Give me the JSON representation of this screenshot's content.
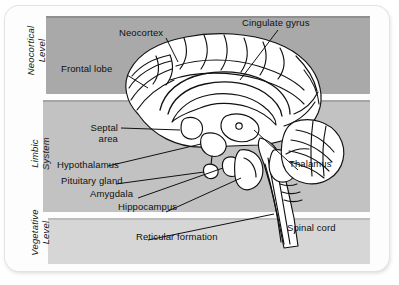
{
  "figure": {
    "kind": "mid-sagittal-brain-diagram",
    "background_color": "#ffffff"
  },
  "levels": [
    {
      "id": "neocortical",
      "label": "Neocortical\nLevel",
      "band_color": "#a9a9a9"
    },
    {
      "id": "limbic",
      "label": "Limbic\nSystem",
      "band_color": "#c2c2c2"
    },
    {
      "id": "vegetative",
      "label": "Vegetative\nLevel",
      "band_color": "#d6d6d6"
    }
  ],
  "labels": {
    "neocortex": "Neocortex",
    "cingulate_gyrus": "Cingulate gyrus",
    "frontal_lobe": "Frontal lobe",
    "septal_area": "Septal\narea",
    "hypothalamus": "Hypothalamus",
    "pituitary_gland": "Pituitary gland",
    "amygdala": "Amygdala",
    "hippocampus": "Hippocampus",
    "reticular_formation": "Reticular formation",
    "thalamus": "Thalamus",
    "spinal_cord": "Spinal cord"
  },
  "style": {
    "line_color": "#111111",
    "brain_fill": "#ffffff",
    "text_color": "#101010"
  }
}
